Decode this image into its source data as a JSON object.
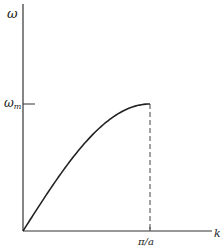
{
  "chart_data": {
    "type": "line",
    "title": "",
    "xlabel": "k",
    "ylabel": "ω",
    "xlim": [
      0,
      "π/a"
    ],
    "ylim": [
      0,
      "ω_m"
    ],
    "x_ticks": [
      {
        "value": "π/a",
        "label": "π/a"
      }
    ],
    "y_ticks": [
      {
        "value": "ω_m",
        "label": "ω_m"
      }
    ],
    "grid": false,
    "legend": null,
    "series": [
      {
        "name": "ω(k)",
        "function": "ω = ω_m · sin(ka/2)",
        "x_fraction_of_pi_over_a": [
          0,
          0.125,
          0.25,
          0.375,
          0.5,
          0.625,
          0.75,
          0.875,
          1.0
        ],
        "y_fraction_of_omega_m": [
          0,
          0.195,
          0.383,
          0.556,
          0.707,
          0.831,
          0.924,
          0.981,
          1.0
        ]
      }
    ],
    "annotations": [
      {
        "type": "dashed-vertical-line",
        "at_x": "π/a",
        "from_y": 0,
        "to_y": "ω_m"
      },
      {
        "type": "tick",
        "axis": "y",
        "at": "ω_m"
      }
    ]
  },
  "labels": {
    "y_axis": "ω",
    "y_tick_main": "ω",
    "y_tick_sub": "m",
    "x_axis": "k",
    "x_tick": "π/a"
  },
  "colors": {
    "axis": "#333333",
    "curve": "#222222",
    "background": "#ffffff"
  }
}
